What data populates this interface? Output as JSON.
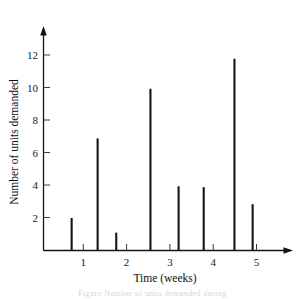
{
  "chart_data": {
    "type": "bar",
    "title": "",
    "subtitle": "",
    "xlabel": "Time (weeks)",
    "ylabel": "Number of units demanded",
    "xlim": [
      0,
      5.6
    ],
    "ylim": [
      0,
      13.2
    ],
    "grid": false,
    "legend": null,
    "xticks": [
      1,
      2,
      3,
      4,
      5
    ],
    "xtick_labels": [
      "1",
      "2",
      "3",
      "4",
      "5"
    ],
    "yticks": [
      2,
      4,
      6,
      8,
      10,
      12
    ],
    "ytick_labels": [
      "2",
      "4",
      "6",
      "8",
      "10",
      "12"
    ],
    "style": "impulse-spikes",
    "x": [
      0.65,
      1.25,
      1.68,
      2.47,
      3.12,
      3.7,
      4.41,
      4.83
    ],
    "values": [
      2.0,
      6.9,
      1.1,
      9.95,
      3.95,
      3.9,
      11.8,
      2.85
    ],
    "categories": [
      "0.65",
      "1.25",
      "1.68",
      "2.47",
      "3.12",
      "3.70",
      "4.41",
      "4.83"
    ],
    "series": [
      {
        "name": "units demanded",
        "points": [
          {
            "x": 0.65,
            "y": 2.0
          },
          {
            "x": 1.25,
            "y": 6.9
          },
          {
            "x": 1.68,
            "y": 1.1
          },
          {
            "x": 2.47,
            "y": 9.95
          },
          {
            "x": 3.12,
            "y": 3.95
          },
          {
            "x": 3.7,
            "y": 3.9
          },
          {
            "x": 4.41,
            "y": 11.8
          },
          {
            "x": 4.83,
            "y": 2.85
          }
        ]
      }
    ],
    "colors": {
      "spike": "#141414",
      "axis": "#141414",
      "text": "#111111"
    }
  },
  "axes": {
    "y_title": "Number of units demanded",
    "x_title": "Time (weeks)"
  },
  "caption": {
    "ghost_text": "Figure  Number of units demanded during"
  }
}
